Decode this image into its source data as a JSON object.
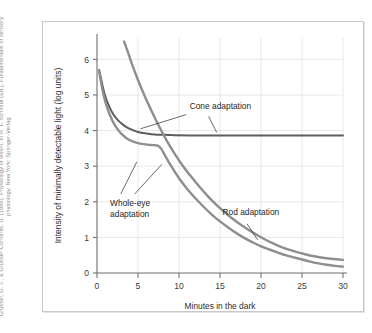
{
  "credit": {
    "text": "Grusser, O. J., & Grusser-Cornehls, U. (1986). Physiology of vision. In R. F. Schmidt (Ed.), Fundamentals of sensory physiology. New York: Springer-Verlag"
  },
  "figure": {
    "background_color": "#ffffff",
    "frame_color": "#c9c9c9"
  },
  "chart_data": {
    "type": "line",
    "title": "",
    "xlabel": "Minutes in the dark",
    "ylabel": "Intensity of minimally detectable light (log units)",
    "xlim": [
      0,
      30
    ],
    "ylim": [
      0,
      6.6
    ],
    "xticks": [
      0,
      5,
      10,
      15,
      20,
      25,
      30
    ],
    "xtick_labels": [
      "0",
      "5",
      "10",
      "15",
      "20",
      "25",
      "30"
    ],
    "yticks": [
      0,
      1,
      2,
      3,
      4,
      5,
      6
    ],
    "ytick_labels": [
      "0",
      "1",
      "2",
      "3",
      "4",
      "5",
      "6"
    ],
    "grid": true,
    "grid_color": "#d7d7d7",
    "legend": "none",
    "annotations": [
      {
        "label": "Cone adaptation",
        "x": 11.3,
        "y": 4.62
      },
      {
        "label": "Whole-eye adaptation",
        "x": 1.6,
        "y": 1.88
      },
      {
        "label": "Rod adaptation",
        "x": 15.3,
        "y": 1.62
      }
    ],
    "series": [
      {
        "name": "Cone adaptation",
        "color": "#5d5d5d",
        "width": 2.0,
        "x": [
          0.25,
          0.5,
          0.9,
          1.4,
          2.0,
          2.6,
          3.2,
          3.8,
          4.4,
          5.0,
          5.6,
          6.2,
          7.0,
          8.0,
          9.5,
          11.5,
          14.0,
          17.0,
          21.0,
          25.0,
          30.0
        ],
        "values": [
          5.7,
          5.45,
          5.05,
          4.72,
          4.45,
          4.28,
          4.16,
          4.07,
          4.01,
          3.96,
          3.93,
          3.91,
          3.89,
          3.88,
          3.87,
          3.865,
          3.86,
          3.86,
          3.86,
          3.86,
          3.86
        ]
      },
      {
        "name": "Rod adaptation",
        "color": "#8e8e8e",
        "width": 2.4,
        "x": [
          3.3,
          3.8,
          4.4,
          5.0,
          5.8,
          6.6,
          7.5,
          8.5,
          9.5,
          10.5,
          11.5,
          12.5,
          13.5,
          14.5,
          15.5,
          16.5,
          17.5,
          18.5,
          19.5,
          20.5,
          21.5,
          22.5,
          23.5,
          24.5,
          25.5,
          26.5,
          27.5,
          28.5,
          29.5,
          30.0
        ],
        "values": [
          6.5,
          6.18,
          5.78,
          5.42,
          4.98,
          4.58,
          4.15,
          3.72,
          3.34,
          3.0,
          2.7,
          2.42,
          2.16,
          1.93,
          1.72,
          1.53,
          1.36,
          1.21,
          1.07,
          0.94,
          0.83,
          0.73,
          0.65,
          0.58,
          0.52,
          0.47,
          0.43,
          0.4,
          0.38,
          0.37
        ]
      },
      {
        "name": "Whole-eye adaptation",
        "color": "#8e8e8e",
        "width": 2.4,
        "x": [
          0.25,
          0.6,
          1.0,
          1.5,
          2.1,
          2.7,
          3.3,
          3.9,
          4.5,
          5.1,
          5.7,
          6.3,
          6.9,
          7.4,
          7.8,
          8.3,
          9.0,
          10.0,
          11.0,
          12.0,
          13.0,
          14.0,
          15.0,
          16.0,
          17.0,
          18.0,
          19.0,
          20.0,
          21.0,
          22.0,
          23.0,
          24.0,
          25.0,
          26.0,
          27.0,
          28.0,
          29.0,
          30.0
        ],
        "values": [
          5.68,
          5.22,
          4.82,
          4.48,
          4.18,
          3.98,
          3.84,
          3.74,
          3.68,
          3.64,
          3.62,
          3.6,
          3.59,
          3.58,
          3.5,
          3.3,
          3.02,
          2.66,
          2.36,
          2.1,
          1.86,
          1.64,
          1.45,
          1.28,
          1.12,
          0.98,
          0.86,
          0.75,
          0.66,
          0.58,
          0.5,
          0.44,
          0.38,
          0.32,
          0.27,
          0.23,
          0.2,
          0.18
        ]
      }
    ]
  }
}
